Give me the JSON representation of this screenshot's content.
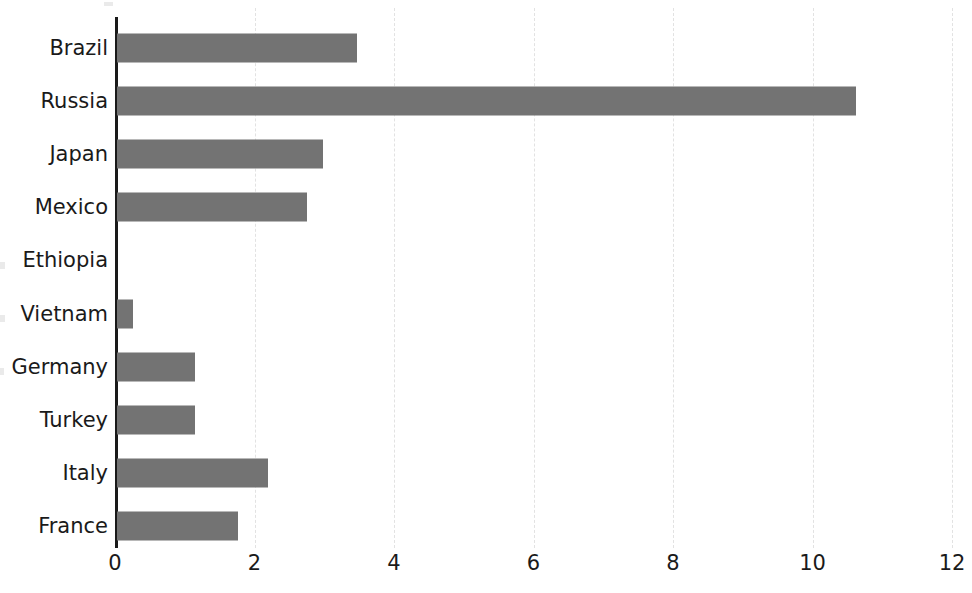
{
  "chart_data": {
    "type": "bar",
    "orientation": "horizontal",
    "title": "",
    "subtitle": "",
    "xlabel": "",
    "ylabel": "",
    "categories": [
      "Brazil",
      "Russia",
      "Japan",
      "Mexico",
      "Ethiopia",
      "Vietnam",
      "Germany",
      "Turkey",
      "Italy",
      "France"
    ],
    "values": [
      3.44,
      10.6,
      2.95,
      2.73,
      0,
      0.23,
      1.12,
      1.12,
      2.16,
      1.73
    ],
    "xlim": [
      0,
      12
    ],
    "ylim": null,
    "xticks": [
      0,
      2,
      4,
      6,
      8,
      10,
      12
    ],
    "xtick_labels": [
      "0",
      "2",
      "4",
      "6",
      "8",
      "10",
      "12"
    ],
    "grid": true,
    "grid_axis": "x",
    "grid_style": "dashed",
    "legend": false,
    "legend_position": "none",
    "series": [
      {
        "name": "",
        "values": [
          3.44,
          10.6,
          2.95,
          2.73,
          0,
          0.23,
          1.12,
          1.12,
          2.16,
          1.73
        ]
      }
    ]
  },
  "colors": {
    "bar_fill": "#737373",
    "axis_line": "#1a1a1a",
    "gridline": "#e2e2e2",
    "tick_text": "#1a1a1a",
    "category_text": "#1a1a1a",
    "background": "#ffffff"
  }
}
